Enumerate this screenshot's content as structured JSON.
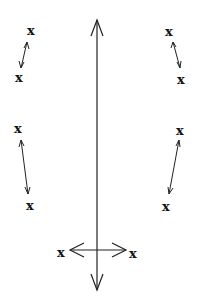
{
  "diagram": {
    "background": "#ffffff",
    "stroke_color": "#222222",
    "marker_label": "x",
    "markers": [
      {
        "id": "top-left-upper",
        "label": "x",
        "x": 31,
        "y": 30
      },
      {
        "id": "top-left-lower",
        "label": "x",
        "x": 19,
        "y": 77
      },
      {
        "id": "top-right-upper",
        "label": "x",
        "x": 169,
        "y": 31
      },
      {
        "id": "top-right-lower",
        "label": "x",
        "x": 181,
        "y": 79
      },
      {
        "id": "mid-left-upper",
        "label": "x",
        "x": 18,
        "y": 128
      },
      {
        "id": "mid-left-lower",
        "label": "x",
        "x": 30,
        "y": 205
      },
      {
        "id": "mid-right-upper",
        "label": "x",
        "x": 180,
        "y": 130
      },
      {
        "id": "mid-right-lower",
        "label": "x",
        "x": 166,
        "y": 206
      },
      {
        "id": "bottom-left",
        "label": "x",
        "x": 61,
        "y": 252
      },
      {
        "id": "bottom-right",
        "label": "x",
        "x": 133,
        "y": 253
      }
    ],
    "arrows": {
      "central_vertical": {
        "x": 97,
        "y_top": 20,
        "y_bottom": 290,
        "heads": [
          "up",
          "down"
        ]
      },
      "horizontal": {
        "y": 250,
        "x_left": 70,
        "x_right": 126,
        "heads": [
          "left",
          "right"
        ]
      },
      "small_double_arrows": [
        {
          "from": [
            27,
            42
          ],
          "to": [
            21,
            68
          ]
        },
        {
          "from": [
            173,
            42
          ],
          "to": [
            180,
            68
          ]
        },
        {
          "from": [
            21,
            140
          ],
          "to": [
            28,
            194
          ]
        },
        {
          "from": [
            179,
            140
          ],
          "to": [
            169,
            194
          ]
        }
      ]
    }
  }
}
